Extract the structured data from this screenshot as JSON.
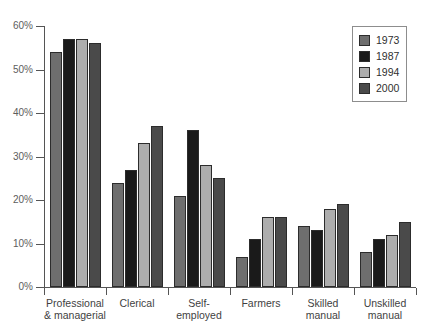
{
  "title": "",
  "chart_data": {
    "type": "bar",
    "title": "",
    "xlabel": "",
    "ylabel": "",
    "ylim": [
      0,
      60
    ],
    "y_ticks": [
      "0%",
      "10%",
      "20%",
      "30%",
      "40%",
      "50%",
      "60%"
    ],
    "y_tick_values": [
      0,
      10,
      20,
      30,
      40,
      50,
      60
    ],
    "grid": false,
    "legend_position": "top-right",
    "categories": [
      "Professional\n& managerial",
      "Clerical",
      "Self-\nemployed",
      "Farmers",
      "Skilled\nmanual",
      "Unskilled\nmanual"
    ],
    "category_lines": [
      [
        "Professional",
        "& managerial"
      ],
      [
        "Clerical",
        ""
      ],
      [
        "Self-",
        "employed"
      ],
      [
        "Farmers",
        ""
      ],
      [
        "Skilled",
        "manual"
      ],
      [
        "Unskilled",
        "manual"
      ]
    ],
    "series": [
      {
        "name": "1973",
        "color": "#6e6e6e",
        "values": [
          54,
          24,
          21,
          7,
          14,
          8
        ]
      },
      {
        "name": "1987",
        "color": "#1a1a1a",
        "values": [
          57,
          27,
          36,
          11,
          13,
          11
        ]
      },
      {
        "name": "1994",
        "color": "#adadad",
        "values": [
          57,
          33,
          28,
          16,
          18,
          12
        ]
      },
      {
        "name": "2000",
        "color": "#4a4a4a",
        "values": [
          56,
          37,
          25,
          16,
          19,
          15
        ]
      }
    ]
  },
  "legend": {
    "items": [
      {
        "label": "1973",
        "color": "#6e6e6e"
      },
      {
        "label": "1987",
        "color": "#1a1a1a"
      },
      {
        "label": "1994",
        "color": "#adadad"
      },
      {
        "label": "2000",
        "color": "#4a4a4a"
      }
    ]
  }
}
